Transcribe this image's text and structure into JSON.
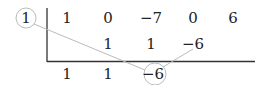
{
  "divisor": "1",
  "rows": {
    "coefficients": [
      "1",
      "0",
      "−7",
      "0",
      "6"
    ],
    "products": [
      "1",
      "1",
      "−6"
    ],
    "results": [
      "1",
      "1",
      "−6"
    ]
  },
  "colors": {
    "rule": "#333333",
    "annotation": "#bbbbbb"
  }
}
